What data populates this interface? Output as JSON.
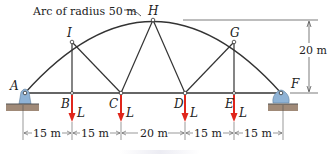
{
  "figure": {
    "type": "truss-diagram",
    "arc_note": "Arc of radius 50 m",
    "height_label": "20 m",
    "load_label": "L",
    "joints": {
      "A": "A",
      "B": "B",
      "C": "C",
      "D": "D",
      "E": "E",
      "F": "F",
      "G": "G",
      "H": "H",
      "I": "I"
    },
    "spans": [
      "15 m",
      "15 m",
      "20 m",
      "15 m",
      "15 m"
    ],
    "colors": {
      "member": "#333333",
      "load_arrow": "#e0261b",
      "support": "#8fb3d6",
      "ground": "#a08a78"
    }
  }
}
